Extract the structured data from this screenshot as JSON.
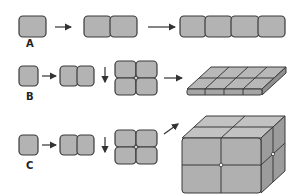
{
  "diagram": {
    "rows": [
      {
        "label": "A",
        "description": "single cell divides into a linear chain of 2 then 4 cells"
      },
      {
        "label": "B",
        "description": "cells divide in 2 directions forming a flat sheet (2x2 then 4x2 slab)"
      },
      {
        "label": "C",
        "description": "cells divide in 3 directions forming a solid cube (2x2x2)"
      }
    ],
    "colors": {
      "cell_fill": "#b3b3b3",
      "cell_top": "#c8c8c8",
      "cell_side": "#9a9a9a",
      "stroke": "#3a3a3a",
      "arrow": "#333333"
    }
  }
}
